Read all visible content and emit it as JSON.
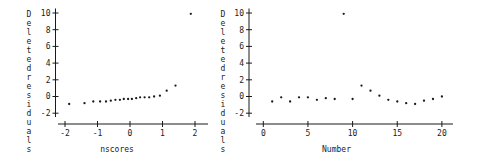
{
  "window": {
    "background": "#ffffff",
    "ink": "#1a1a1a"
  },
  "chart_data": [
    {
      "type": "scatter",
      "title": "",
      "name": "nscores-plot",
      "xlabel": "nscores",
      "ylabel": "Deleted residuals",
      "xlim": [
        -2.3,
        2.4
      ],
      "ylim": [
        -2,
        10
      ],
      "xticks": [
        -2,
        -1,
        0,
        1,
        2
      ],
      "yticks": [
        10,
        8,
        6,
        4,
        2,
        0,
        -2
      ],
      "grid": false,
      "legend": null,
      "marker": "dot",
      "x": [
        -1.87,
        -1.4,
        -1.13,
        -0.92,
        -0.74,
        -0.59,
        -0.45,
        -0.31,
        -0.19,
        -0.06,
        0.06,
        0.19,
        0.31,
        0.45,
        0.59,
        0.74,
        0.92,
        1.13,
        1.4,
        1.87
      ],
      "y": [
        -0.9,
        -0.8,
        -0.6,
        -0.6,
        -0.6,
        -0.5,
        -0.4,
        -0.4,
        -0.3,
        -0.3,
        -0.3,
        -0.2,
        -0.1,
        -0.1,
        -0.1,
        0.0,
        0.1,
        0.7,
        1.3,
        9.9
      ]
    },
    {
      "type": "scatter",
      "title": "",
      "name": "number-plot",
      "xlabel": "Number",
      "ylabel": "Deleted residuals",
      "xlim": [
        -0.8,
        21.2
      ],
      "ylim": [
        -2,
        10
      ],
      "xticks": [
        0,
        5,
        10,
        15,
        20
      ],
      "yticks": [
        10,
        8,
        6,
        4,
        2,
        0,
        -2
      ],
      "grid": false,
      "legend": null,
      "marker": "dot",
      "x": [
        1,
        2,
        3,
        4,
        5,
        6,
        7,
        8,
        9,
        10,
        11,
        12,
        13,
        14,
        15,
        16,
        17,
        18,
        19,
        20
      ],
      "y": [
        -0.6,
        -0.1,
        -0.6,
        -0.1,
        -0.1,
        -0.4,
        -0.2,
        -0.3,
        9.9,
        -0.3,
        1.3,
        0.7,
        0.1,
        -0.4,
        -0.6,
        -0.8,
        -0.9,
        -0.5,
        -0.3,
        0.0
      ]
    }
  ]
}
